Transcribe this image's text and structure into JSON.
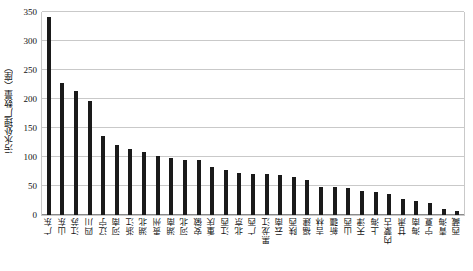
{
  "chart_data": {
    "type": "bar",
    "title": "",
    "xlabel": "",
    "ylabel": "污水处理厂数量（座）",
    "ylim": [
      0,
      350
    ],
    "yticks": [
      0,
      50,
      100,
      150,
      200,
      250,
      300,
      350
    ],
    "ytick_labels": [
      "0",
      "50",
      "100",
      "150",
      "200",
      "250",
      "300",
      "350"
    ],
    "grid": true,
    "legend": false,
    "bar_color": "#1a1a1a",
    "grid_color": "#c9c9c9",
    "categories": [
      "广东",
      "山东",
      "江苏",
      "四川",
      "辽宁",
      "河南",
      "浙江",
      "湖北",
      "贵州",
      "湖南",
      "河北",
      "安徽",
      "重庆",
      "江西",
      "北京",
      "广西",
      "黑龙江",
      "云南",
      "陕西",
      "福建",
      "吉林",
      "新疆",
      "山西",
      "天津",
      "上海",
      "内蒙古",
      "甘肃",
      "海南",
      "宁夏",
      "青海",
      "西藏"
    ],
    "values": [
      341,
      228,
      214,
      196,
      136,
      120,
      114,
      108,
      101,
      98,
      94,
      94,
      83,
      77,
      73,
      71,
      71,
      69,
      65,
      61,
      48,
      48,
      47,
      42,
      40,
      37,
      27,
      24,
      20,
      11,
      7
    ]
  }
}
